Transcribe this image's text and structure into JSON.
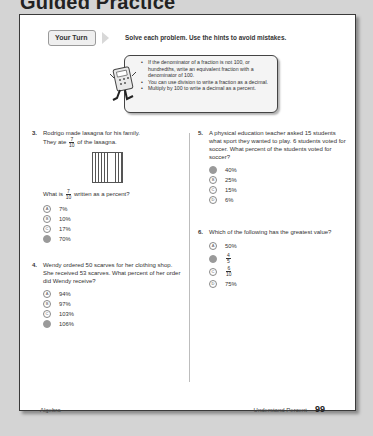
{
  "section_title": "Guided Practice",
  "your_turn": {
    "label": "Your Turn",
    "instructions": "Solve each problem. Use the hints to avoid mistakes."
  },
  "hints": [
    "If the denominator of a fraction is not 100, or hundredths, write an equivalent fraction with a denominator of 100.",
    "You can use division to write a fraction as a decimal.",
    "Multiply by 100 to write a decimal as a percent."
  ],
  "questions": {
    "q3": {
      "number": "3.",
      "text_1": "Rodrigo made lasagna for his family.",
      "text_2_pre": "They ate",
      "fraction_num": "7",
      "fraction_den": "10",
      "text_2_post": "of the lasagna.",
      "prompt_pre": "What is",
      "prompt_post": "written as a percent?",
      "options": [
        {
          "letter": "A",
          "text": "7%",
          "selected": false
        },
        {
          "letter": "B",
          "text": "10%",
          "selected": false
        },
        {
          "letter": "C",
          "text": "17%",
          "selected": false
        },
        {
          "letter": "D",
          "text": "70%",
          "selected": true
        }
      ]
    },
    "q4": {
      "number": "4.",
      "text": "Wendy ordered 50 scarves for her clothing shop. She received 53 scarves. What percent of her order did Wendy receive?",
      "options": [
        {
          "letter": "A",
          "text": "94%",
          "selected": false
        },
        {
          "letter": "B",
          "text": "97%",
          "selected": false
        },
        {
          "letter": "C",
          "text": "103%",
          "selected": false
        },
        {
          "letter": "D",
          "text": "106%",
          "selected": true
        }
      ]
    },
    "q5": {
      "number": "5.",
      "text": "A physical education teacher asked 15 students what sport they wanted to play. 6 students voted for soccer. What percent of the students voted for soccer?",
      "options": [
        {
          "letter": "A",
          "text": "40%",
          "selected": true
        },
        {
          "letter": "B",
          "text": "25%",
          "selected": false
        },
        {
          "letter": "C",
          "text": "15%",
          "selected": false
        },
        {
          "letter": "D",
          "text": "6%",
          "selected": false
        }
      ]
    },
    "q6": {
      "number": "6.",
      "text": "Which of the following has the greatest value?",
      "options": [
        {
          "letter": "A",
          "text": "50%",
          "selected": false
        },
        {
          "letter": "B",
          "num": "4",
          "den": "5",
          "selected": true
        },
        {
          "letter": "C",
          "num": "6",
          "den": "10",
          "selected": false
        },
        {
          "letter": "D",
          "text": "75%",
          "selected": false
        }
      ]
    }
  },
  "footer": {
    "left": "Algebra",
    "right": "Understand Percent",
    "page_number": "99"
  }
}
